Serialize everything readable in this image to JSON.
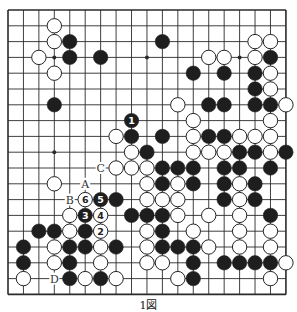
{
  "diagram": {
    "type": "go-board",
    "size": 19,
    "caption": "1図",
    "colors": {
      "board": "#ffffff",
      "line": "#2a2a2a",
      "black": "#1e1e1e",
      "white": "#ffffff"
    },
    "star_points": [
      [
        3,
        3
      ],
      [
        9,
        3
      ],
      [
        15,
        3
      ],
      [
        3,
        9
      ],
      [
        9,
        9
      ],
      [
        15,
        9
      ],
      [
        3,
        15
      ],
      [
        9,
        15
      ],
      [
        15,
        15
      ]
    ],
    "stones": [
      {
        "c": 3,
        "r": 1,
        "color": "W"
      },
      {
        "c": 3,
        "r": 2,
        "color": "W"
      },
      {
        "c": 4,
        "r": 2,
        "color": "B"
      },
      {
        "c": 10,
        "r": 2,
        "color": "B"
      },
      {
        "c": 16,
        "r": 2,
        "color": "W"
      },
      {
        "c": 17,
        "r": 2,
        "color": "W"
      },
      {
        "c": 2,
        "r": 3,
        "color": "W"
      },
      {
        "c": 4,
        "r": 3,
        "color": "B"
      },
      {
        "c": 6,
        "r": 3,
        "color": "B"
      },
      {
        "c": 13,
        "r": 3,
        "color": "W"
      },
      {
        "c": 14,
        "r": 3,
        "color": "W"
      },
      {
        "c": 16,
        "r": 3,
        "color": "W"
      },
      {
        "c": 17,
        "r": 3,
        "color": "B"
      },
      {
        "c": 3,
        "r": 4,
        "color": "W"
      },
      {
        "c": 12,
        "r": 4,
        "color": "B"
      },
      {
        "c": 14,
        "r": 4,
        "color": "B"
      },
      {
        "c": 16,
        "r": 4,
        "color": "B"
      },
      {
        "c": 17,
        "r": 4,
        "color": "W"
      },
      {
        "c": 16,
        "r": 5,
        "color": "B"
      },
      {
        "c": 17,
        "r": 5,
        "color": "W"
      },
      {
        "c": 3,
        "r": 6,
        "color": "B"
      },
      {
        "c": 11,
        "r": 6,
        "color": "W"
      },
      {
        "c": 13,
        "r": 6,
        "color": "B"
      },
      {
        "c": 14,
        "r": 6,
        "color": "B"
      },
      {
        "c": 16,
        "r": 6,
        "color": "B"
      },
      {
        "c": 17,
        "r": 6,
        "color": "B"
      },
      {
        "c": 18,
        "r": 6,
        "color": "W"
      },
      {
        "c": 8,
        "r": 7,
        "color": "B",
        "label": "1"
      },
      {
        "c": 12,
        "r": 7,
        "color": "W"
      },
      {
        "c": 17,
        "r": 7,
        "color": "W"
      },
      {
        "c": 7,
        "r": 8,
        "color": "W"
      },
      {
        "c": 8,
        "r": 8,
        "color": "B"
      },
      {
        "c": 10,
        "r": 8,
        "color": "B"
      },
      {
        "c": 12,
        "r": 8,
        "color": "W"
      },
      {
        "c": 13,
        "r": 8,
        "color": "B"
      },
      {
        "c": 14,
        "r": 8,
        "color": "B"
      },
      {
        "c": 15,
        "r": 8,
        "color": "W"
      },
      {
        "c": 16,
        "r": 8,
        "color": "W"
      },
      {
        "c": 17,
        "r": 8,
        "color": "W"
      },
      {
        "c": 8,
        "r": 9,
        "color": "W"
      },
      {
        "c": 9,
        "r": 9,
        "color": "B"
      },
      {
        "c": 12,
        "r": 9,
        "color": "W"
      },
      {
        "c": 13,
        "r": 9,
        "color": "W"
      },
      {
        "c": 14,
        "r": 9,
        "color": "W"
      },
      {
        "c": 15,
        "r": 9,
        "color": "B"
      },
      {
        "c": 16,
        "r": 9,
        "color": "B"
      },
      {
        "c": 17,
        "r": 9,
        "color": "W"
      },
      {
        "c": 18,
        "r": 9,
        "color": "B"
      },
      {
        "c": 7,
        "r": 10,
        "color": "W"
      },
      {
        "c": 8,
        "r": 10,
        "color": "W"
      },
      {
        "c": 9,
        "r": 10,
        "color": "W"
      },
      {
        "c": 10,
        "r": 10,
        "color": "B"
      },
      {
        "c": 11,
        "r": 10,
        "color": "B"
      },
      {
        "c": 12,
        "r": 10,
        "color": "B"
      },
      {
        "c": 14,
        "r": 10,
        "color": "B"
      },
      {
        "c": 15,
        "r": 10,
        "color": "B"
      },
      {
        "c": 17,
        "r": 10,
        "color": "B"
      },
      {
        "c": 3,
        "r": 11,
        "color": "W"
      },
      {
        "c": 9,
        "r": 11,
        "color": "W"
      },
      {
        "c": 10,
        "r": 11,
        "color": "B"
      },
      {
        "c": 11,
        "r": 11,
        "color": "W"
      },
      {
        "c": 12,
        "r": 11,
        "color": "B"
      },
      {
        "c": 14,
        "r": 11,
        "color": "B"
      },
      {
        "c": 15,
        "r": 11,
        "color": "W"
      },
      {
        "c": 16,
        "r": 11,
        "color": "B"
      },
      {
        "c": 5,
        "r": 12,
        "color": "W",
        "label": "6"
      },
      {
        "c": 6,
        "r": 12,
        "color": "B",
        "label": "5"
      },
      {
        "c": 7,
        "r": 12,
        "color": "B"
      },
      {
        "c": 9,
        "r": 12,
        "color": "W"
      },
      {
        "c": 10,
        "r": 12,
        "color": "W"
      },
      {
        "c": 11,
        "r": 12,
        "color": "W"
      },
      {
        "c": 14,
        "r": 12,
        "color": "B"
      },
      {
        "c": 15,
        "r": 12,
        "color": "W"
      },
      {
        "c": 16,
        "r": 12,
        "color": "B"
      },
      {
        "c": 4,
        "r": 13,
        "color": "W"
      },
      {
        "c": 5,
        "r": 13,
        "color": "B",
        "label": "3"
      },
      {
        "c": 6,
        "r": 13,
        "color": "W",
        "label": "4"
      },
      {
        "c": 8,
        "r": 13,
        "color": "B"
      },
      {
        "c": 9,
        "r": 13,
        "color": "B"
      },
      {
        "c": 10,
        "r": 13,
        "color": "B"
      },
      {
        "c": 11,
        "r": 13,
        "color": "W"
      },
      {
        "c": 13,
        "r": 13,
        "color": "W"
      },
      {
        "c": 15,
        "r": 13,
        "color": "W"
      },
      {
        "c": 17,
        "r": 13,
        "color": "B"
      },
      {
        "c": 2,
        "r": 14,
        "color": "B"
      },
      {
        "c": 3,
        "r": 14,
        "color": "B"
      },
      {
        "c": 4,
        "r": 14,
        "color": "W"
      },
      {
        "c": 5,
        "r": 14,
        "color": "B"
      },
      {
        "c": 6,
        "r": 14,
        "color": "W",
        "label": "2"
      },
      {
        "c": 9,
        "r": 14,
        "color": "W"
      },
      {
        "c": 10,
        "r": 14,
        "color": "B"
      },
      {
        "c": 12,
        "r": 14,
        "color": "W"
      },
      {
        "c": 15,
        "r": 14,
        "color": "W"
      },
      {
        "c": 17,
        "r": 14,
        "color": "W"
      },
      {
        "c": 1,
        "r": 15,
        "color": "B"
      },
      {
        "c": 3,
        "r": 15,
        "color": "W"
      },
      {
        "c": 4,
        "r": 15,
        "color": "B"
      },
      {
        "c": 5,
        "r": 15,
        "color": "B"
      },
      {
        "c": 6,
        "r": 15,
        "color": "W"
      },
      {
        "c": 7,
        "r": 15,
        "color": "B"
      },
      {
        "c": 9,
        "r": 15,
        "color": "W"
      },
      {
        "c": 10,
        "r": 15,
        "color": "B"
      },
      {
        "c": 11,
        "r": 15,
        "color": "B"
      },
      {
        "c": 12,
        "r": 15,
        "color": "B"
      },
      {
        "c": 13,
        "r": 15,
        "color": "W"
      },
      {
        "c": 15,
        "r": 15,
        "color": "W"
      },
      {
        "c": 17,
        "r": 15,
        "color": "W"
      },
      {
        "c": 1,
        "r": 16,
        "color": "B"
      },
      {
        "c": 3,
        "r": 16,
        "color": "W"
      },
      {
        "c": 4,
        "r": 16,
        "color": "B"
      },
      {
        "c": 6,
        "r": 16,
        "color": "W"
      },
      {
        "c": 9,
        "r": 16,
        "color": "W"
      },
      {
        "c": 10,
        "r": 16,
        "color": "W"
      },
      {
        "c": 12,
        "r": 16,
        "color": "B"
      },
      {
        "c": 14,
        "r": 16,
        "color": "B"
      },
      {
        "c": 15,
        "r": 16,
        "color": "B"
      },
      {
        "c": 16,
        "r": 16,
        "color": "B"
      },
      {
        "c": 17,
        "r": 16,
        "color": "B"
      },
      {
        "c": 18,
        "r": 16,
        "color": "W"
      },
      {
        "c": 1,
        "r": 17,
        "color": "W"
      },
      {
        "c": 4,
        "r": 17,
        "color": "B"
      },
      {
        "c": 5,
        "r": 17,
        "color": "W"
      },
      {
        "c": 6,
        "r": 17,
        "color": "B"
      },
      {
        "c": 7,
        "r": 17,
        "color": "W"
      },
      {
        "c": 11,
        "r": 17,
        "color": "W"
      },
      {
        "c": 12,
        "r": 17,
        "color": "B"
      },
      {
        "c": 17,
        "r": 17,
        "color": "W"
      }
    ],
    "point_labels": [
      {
        "c": 6,
        "r": 10,
        "text": "C"
      },
      {
        "c": 5,
        "r": 11,
        "text": "A"
      },
      {
        "c": 4,
        "r": 12,
        "text": "B"
      },
      {
        "c": 3,
        "r": 17,
        "text": "D"
      }
    ]
  }
}
